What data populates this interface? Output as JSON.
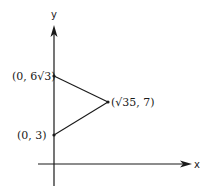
{
  "diagram": {
    "type": "coordinate-plane-triangle",
    "axes": {
      "x_label": "x",
      "y_label": "y"
    },
    "points": [
      {
        "id": "A",
        "label": "(0, 6√3)",
        "x_expr": "0",
        "y_expr": "6√3"
      },
      {
        "id": "B",
        "label": "(√35, 7)",
        "x_expr": "√35",
        "y_expr": "7"
      },
      {
        "id": "C",
        "label": "(0, 3)",
        "x_expr": "0",
        "y_expr": "3"
      }
    ],
    "segments": [
      {
        "from": "A",
        "to": "B"
      },
      {
        "from": "B",
        "to": "C"
      },
      {
        "from": "C",
        "to": "A",
        "note": "lies on y-axis"
      }
    ],
    "colors": {
      "ink": "#1a1a1a",
      "background": "#ffffff"
    }
  }
}
